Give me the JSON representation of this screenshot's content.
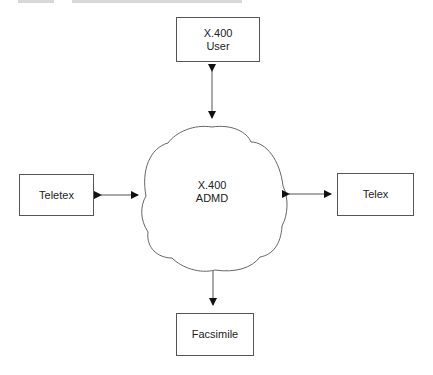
{
  "diagram": {
    "center": {
      "line1": "X.400",
      "line2": "ADMD"
    },
    "nodes": {
      "top": {
        "line1": "X.400",
        "line2": "User"
      },
      "left": {
        "label": "Teletex"
      },
      "right": {
        "label": "Telex"
      },
      "bottom": {
        "label": "Facsimile"
      }
    },
    "connections": [
      {
        "from": "X.400 User",
        "to": "X.400 ADMD",
        "type": "bidirectional"
      },
      {
        "from": "Teletex",
        "to": "X.400 ADMD",
        "type": "bidirectional"
      },
      {
        "from": "Telex",
        "to": "X.400 ADMD",
        "type": "bidirectional"
      },
      {
        "from": "X.400 ADMD",
        "to": "Facsimile",
        "type": "unidirectional"
      }
    ],
    "colors": {
      "stroke": "#555555",
      "text": "#222222",
      "background": "#ffffff"
    }
  }
}
